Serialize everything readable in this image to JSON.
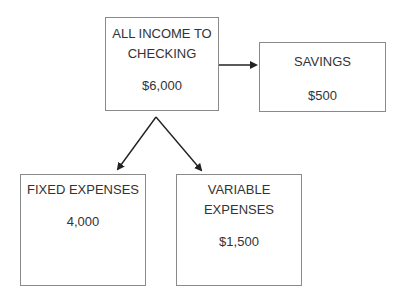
{
  "diagram": {
    "nodes": {
      "main": {
        "title": "ALL INCOME TO CHECKING",
        "value": "$6,000"
      },
      "savings": {
        "title": "SAVINGS",
        "value": "$500"
      },
      "fixed": {
        "title": "FIXED EXPENSES",
        "value": "4,000"
      },
      "variable": {
        "title": "VARIABLE EXPENSES",
        "value": "$1,500"
      }
    },
    "edges": [
      {
        "from": "main",
        "to": "savings"
      },
      {
        "from": "main",
        "to": "fixed"
      },
      {
        "from": "main",
        "to": "variable"
      }
    ],
    "colors": {
      "border": "#8a8a8a",
      "arrow": "#222222",
      "text": "#333333"
    }
  }
}
